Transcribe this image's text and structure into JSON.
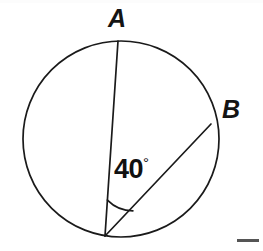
{
  "figure": {
    "kind": "circle-geometry-diagram",
    "background_color": "#ffffff",
    "stroke_color": "#1a1a1a",
    "text_color": "#111111",
    "width": 263,
    "height": 251,
    "labels": {
      "point_a": "A",
      "point_b": "B",
      "angle_value": "40",
      "degree_symbol": "°"
    },
    "circle": {
      "center_x": 121,
      "center_y": 139,
      "radius": 98,
      "stroke_width": 1.6
    },
    "points": {
      "a": {
        "x": 118,
        "y": 41
      },
      "b": {
        "x": 211,
        "y": 124
      },
      "vertex": {
        "x": 105,
        "y": 236
      }
    },
    "chords": [
      {
        "name": "vertex-to-a",
        "x1": 105,
        "y1": 236,
        "x2": 118,
        "y2": 41
      },
      {
        "name": "vertex-to-b",
        "x1": 105,
        "y1": 236,
        "x2": 211,
        "y2": 124
      }
    ],
    "angle_arc": {
      "radius": 36,
      "start_x": 107.4,
      "start_y": 200.1,
      "end_x": 132.9,
      "end_y": 210.8
    },
    "bottom_rule": {
      "x": 237,
      "y": 239,
      "width": 22,
      "height": 3,
      "color": "#555555"
    }
  }
}
